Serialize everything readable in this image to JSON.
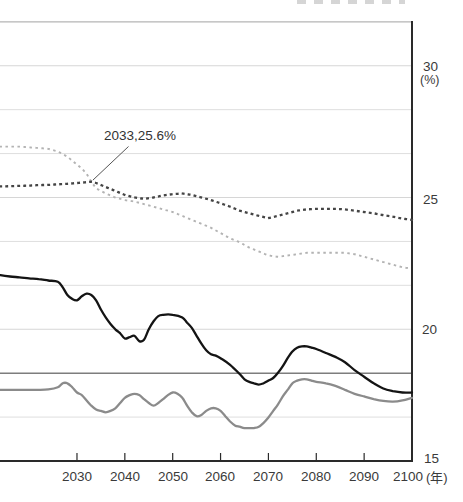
{
  "chart_data": {
    "type": "line",
    "x_unit": "(年)",
    "y_unit": "(%)",
    "x_ticks": [
      2030,
      2040,
      2050,
      2060,
      2070,
      2080,
      2090,
      2100
    ],
    "x_tick_labels": [
      "2030",
      "2040",
      "2050",
      "2060",
      "2070",
      "2080",
      "2090",
      "2100"
    ],
    "y_ticks": [
      15,
      20,
      25,
      30
    ],
    "y_tick_labels": [
      "15",
      "20",
      "25",
      "30"
    ],
    "x_range": [
      2014,
      2100
    ],
    "y_range": [
      15,
      31.7
    ],
    "grid": {
      "minor_values": [
        16.667,
        21.667,
        23.333,
        26.667,
        28.333
      ],
      "major_values": [
        20,
        25,
        30
      ],
      "top_border_value": 31.667
    },
    "reference_line": {
      "value": 18.33,
      "color": "#7d7d7d"
    },
    "annotation": {
      "label": "2033,25.6%",
      "year": 2033,
      "value": 25.6
    },
    "axis_color": "#2a2a2a",
    "gridline_color": "#dedede",
    "series": [
      {
        "name": "light-dotted-projection",
        "style": "dotted",
        "color": "#b3b3b3",
        "points": [
          [
            2014,
            26.93
          ],
          [
            2016,
            26.93
          ],
          [
            2018,
            26.93
          ],
          [
            2020,
            26.9
          ],
          [
            2022,
            26.88
          ],
          [
            2024,
            26.85
          ],
          [
            2026,
            26.75
          ],
          [
            2028,
            26.55
          ],
          [
            2030,
            26.25
          ],
          [
            2031,
            26.1
          ],
          [
            2032,
            25.9
          ],
          [
            2033,
            25.6
          ],
          [
            2034,
            25.35
          ],
          [
            2035,
            25.25
          ],
          [
            2036,
            25.15
          ],
          [
            2038,
            25.0
          ],
          [
            2040,
            24.9
          ],
          [
            2042,
            24.85
          ],
          [
            2044,
            24.75
          ],
          [
            2046,
            24.65
          ],
          [
            2048,
            24.55
          ],
          [
            2050,
            24.45
          ],
          [
            2052,
            24.3
          ],
          [
            2054,
            24.15
          ],
          [
            2056,
            24.0
          ],
          [
            2058,
            23.85
          ],
          [
            2060,
            23.65
          ],
          [
            2062,
            23.45
          ],
          [
            2064,
            23.3
          ],
          [
            2066,
            23.1
          ],
          [
            2068,
            22.95
          ],
          [
            2070,
            22.8
          ],
          [
            2072,
            22.75
          ],
          [
            2074,
            22.8
          ],
          [
            2076,
            22.85
          ],
          [
            2078,
            22.9
          ],
          [
            2080,
            22.9
          ],
          [
            2082,
            22.9
          ],
          [
            2084,
            22.9
          ],
          [
            2086,
            22.9
          ],
          [
            2088,
            22.85
          ],
          [
            2090,
            22.75
          ],
          [
            2092,
            22.65
          ],
          [
            2094,
            22.55
          ],
          [
            2096,
            22.45
          ],
          [
            2098,
            22.35
          ],
          [
            2100,
            22.3
          ]
        ]
      },
      {
        "name": "dark-dotted-projection",
        "style": "dotted",
        "color": "#454545",
        "points": [
          [
            2014,
            25.42
          ],
          [
            2016,
            25.43
          ],
          [
            2018,
            25.44
          ],
          [
            2020,
            25.45
          ],
          [
            2022,
            25.47
          ],
          [
            2024,
            25.48
          ],
          [
            2026,
            25.5
          ],
          [
            2028,
            25.52
          ],
          [
            2030,
            25.55
          ],
          [
            2032,
            25.58
          ],
          [
            2033,
            25.6
          ],
          [
            2034,
            25.55
          ],
          [
            2036,
            25.4
          ],
          [
            2038,
            25.25
          ],
          [
            2040,
            25.1
          ],
          [
            2042,
            25.0
          ],
          [
            2044,
            24.95
          ],
          [
            2046,
            25.0
          ],
          [
            2048,
            25.08
          ],
          [
            2050,
            25.13
          ],
          [
            2052,
            25.15
          ],
          [
            2054,
            25.1
          ],
          [
            2056,
            25.0
          ],
          [
            2058,
            24.9
          ],
          [
            2060,
            24.78
          ],
          [
            2062,
            24.65
          ],
          [
            2064,
            24.5
          ],
          [
            2066,
            24.4
          ],
          [
            2068,
            24.3
          ],
          [
            2070,
            24.22
          ],
          [
            2072,
            24.3
          ],
          [
            2074,
            24.4
          ],
          [
            2076,
            24.5
          ],
          [
            2078,
            24.55
          ],
          [
            2080,
            24.57
          ],
          [
            2082,
            24.57
          ],
          [
            2084,
            24.57
          ],
          [
            2086,
            24.55
          ],
          [
            2088,
            24.5
          ],
          [
            2090,
            24.45
          ],
          [
            2092,
            24.4
          ],
          [
            2094,
            24.33
          ],
          [
            2096,
            24.27
          ],
          [
            2098,
            24.2
          ],
          [
            2100,
            24.15
          ]
        ]
      },
      {
        "name": "gray-solid-series",
        "style": "solid",
        "color": "#8b8b8b",
        "points": [
          [
            2014,
            17.7
          ],
          [
            2016,
            17.7
          ],
          [
            2018,
            17.7
          ],
          [
            2020,
            17.7
          ],
          [
            2022,
            17.7
          ],
          [
            2024,
            17.72
          ],
          [
            2026,
            17.8
          ],
          [
            2027,
            17.95
          ],
          [
            2028,
            17.95
          ],
          [
            2029,
            17.8
          ],
          [
            2030,
            17.6
          ],
          [
            2031,
            17.5
          ],
          [
            2032,
            17.3
          ],
          [
            2033,
            17.1
          ],
          [
            2034,
            16.95
          ],
          [
            2035,
            16.9
          ],
          [
            2036,
            16.85
          ],
          [
            2037,
            16.9
          ],
          [
            2038,
            17.0
          ],
          [
            2039,
            17.2
          ],
          [
            2040,
            17.4
          ],
          [
            2041,
            17.5
          ],
          [
            2042,
            17.55
          ],
          [
            2043,
            17.5
          ],
          [
            2044,
            17.35
          ],
          [
            2045,
            17.2
          ],
          [
            2046,
            17.1
          ],
          [
            2047,
            17.2
          ],
          [
            2048,
            17.35
          ],
          [
            2049,
            17.5
          ],
          [
            2050,
            17.6
          ],
          [
            2051,
            17.55
          ],
          [
            2052,
            17.4
          ],
          [
            2053,
            17.1
          ],
          [
            2054,
            16.85
          ],
          [
            2055,
            16.7
          ],
          [
            2056,
            16.75
          ],
          [
            2057,
            16.9
          ],
          [
            2058,
            17.0
          ],
          [
            2059,
            17.0
          ],
          [
            2060,
            16.9
          ],
          [
            2061,
            16.7
          ],
          [
            2062,
            16.5
          ],
          [
            2063,
            16.35
          ],
          [
            2064,
            16.3
          ],
          [
            2065,
            16.25
          ],
          [
            2066,
            16.25
          ],
          [
            2067,
            16.25
          ],
          [
            2068,
            16.3
          ],
          [
            2069,
            16.45
          ],
          [
            2070,
            16.65
          ],
          [
            2071,
            16.9
          ],
          [
            2072,
            17.15
          ],
          [
            2073,
            17.45
          ],
          [
            2074,
            17.7
          ],
          [
            2075,
            17.95
          ],
          [
            2076,
            18.05
          ],
          [
            2077,
            18.1
          ],
          [
            2078,
            18.1
          ],
          [
            2079,
            18.05
          ],
          [
            2080,
            18.0
          ],
          [
            2082,
            17.95
          ],
          [
            2084,
            17.85
          ],
          [
            2086,
            17.7
          ],
          [
            2088,
            17.55
          ],
          [
            2090,
            17.45
          ],
          [
            2092,
            17.35
          ],
          [
            2094,
            17.28
          ],
          [
            2096,
            17.25
          ],
          [
            2098,
            17.3
          ],
          [
            2100,
            17.4
          ]
        ]
      },
      {
        "name": "black-solid-series",
        "style": "solid",
        "color": "#141414",
        "points": [
          [
            2014,
            22.05
          ],
          [
            2016,
            22.0
          ],
          [
            2018,
            21.97
          ],
          [
            2020,
            21.93
          ],
          [
            2022,
            21.9
          ],
          [
            2024,
            21.85
          ],
          [
            2026,
            21.8
          ],
          [
            2027,
            21.6
          ],
          [
            2028,
            21.3
          ],
          [
            2029,
            21.15
          ],
          [
            2030,
            21.1
          ],
          [
            2031,
            21.25
          ],
          [
            2032,
            21.35
          ],
          [
            2033,
            21.3
          ],
          [
            2034,
            21.1
          ],
          [
            2035,
            20.75
          ],
          [
            2036,
            20.45
          ],
          [
            2037,
            20.2
          ],
          [
            2038,
            20.0
          ],
          [
            2039,
            19.85
          ],
          [
            2040,
            19.65
          ],
          [
            2041,
            19.7
          ],
          [
            2042,
            19.75
          ],
          [
            2043,
            19.55
          ],
          [
            2044,
            19.6
          ],
          [
            2045,
            20.0
          ],
          [
            2046,
            20.3
          ],
          [
            2047,
            20.5
          ],
          [
            2048,
            20.55
          ],
          [
            2050,
            20.55
          ],
          [
            2052,
            20.45
          ],
          [
            2053,
            20.25
          ],
          [
            2054,
            20.05
          ],
          [
            2055,
            19.75
          ],
          [
            2056,
            19.45
          ],
          [
            2057,
            19.2
          ],
          [
            2058,
            19.05
          ],
          [
            2059,
            19.0
          ],
          [
            2060,
            18.9
          ],
          [
            2062,
            18.65
          ],
          [
            2064,
            18.3
          ],
          [
            2065,
            18.1
          ],
          [
            2066,
            18.0
          ],
          [
            2067,
            17.95
          ],
          [
            2068,
            17.9
          ],
          [
            2069,
            17.95
          ],
          [
            2070,
            18.05
          ],
          [
            2071,
            18.15
          ],
          [
            2072,
            18.35
          ],
          [
            2073,
            18.6
          ],
          [
            2074,
            18.9
          ],
          [
            2075,
            19.15
          ],
          [
            2076,
            19.3
          ],
          [
            2077,
            19.35
          ],
          [
            2078,
            19.35
          ],
          [
            2079,
            19.3
          ],
          [
            2080,
            19.25
          ],
          [
            2082,
            19.1
          ],
          [
            2084,
            18.95
          ],
          [
            2086,
            18.75
          ],
          [
            2088,
            18.45
          ],
          [
            2090,
            18.2
          ],
          [
            2092,
            17.95
          ],
          [
            2094,
            17.75
          ],
          [
            2096,
            17.65
          ],
          [
            2098,
            17.6
          ],
          [
            2100,
            17.6
          ]
        ]
      }
    ]
  }
}
